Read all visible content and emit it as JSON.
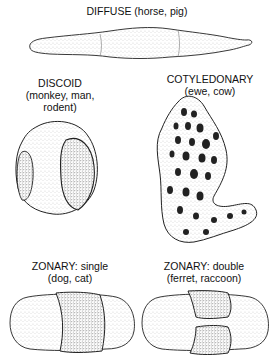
{
  "diagram": {
    "panels": [
      {
        "id": "diffuse",
        "heading": "DIFFUSE (horse, pig)",
        "sub": ""
      },
      {
        "id": "discoid",
        "heading": "DISCOID",
        "sub_lines": [
          "(monkey, man,",
          "rodent)"
        ]
      },
      {
        "id": "cotyledonary",
        "heading": "COTYLEDONARY",
        "sub": "(ewe, cow)"
      },
      {
        "id": "zonary-single",
        "heading": "ZONARY: single",
        "sub": "(dog, cat)"
      },
      {
        "id": "zonary-double",
        "heading": "ZONARY: double",
        "sub": "(ferret, raccoon)"
      }
    ]
  }
}
